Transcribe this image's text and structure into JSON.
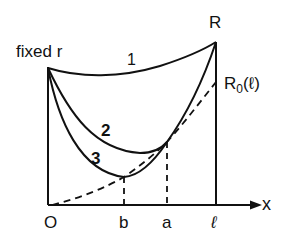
{
  "diagram": {
    "labels": {
      "fixed_r": "fixed r",
      "R": "R",
      "R0": "R",
      "R0_sub": "0",
      "R0_arg": "(ℓ)",
      "curve1": "1",
      "curve2": "2",
      "curve3": "3",
      "origin": "O",
      "b": "b",
      "a": "a",
      "ell": "ℓ",
      "x": "x"
    },
    "colors": {
      "ink": "#111111",
      "background": "#ffffff"
    }
  }
}
